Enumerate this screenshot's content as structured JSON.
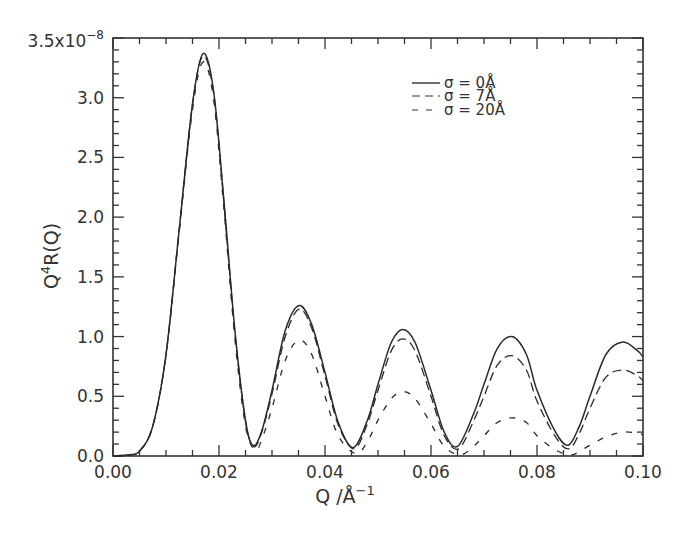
{
  "chart_data": {
    "type": "line",
    "title": "",
    "xlabel": "Q  /Å⁻¹",
    "ylabel": "Q⁴R(Q)",
    "xlim": [
      0.0,
      0.1
    ],
    "ylim": [
      0.0,
      3.5
    ],
    "y_scale_label": "3.5x10⁻⁸",
    "x_ticks": [
      "0.00",
      "0.02",
      "0.04",
      "0.06",
      "0.08",
      "0.10"
    ],
    "x_tick_values": [
      0.0,
      0.02,
      0.04,
      0.06,
      0.08,
      0.1
    ],
    "y_ticks": [
      "0.0",
      "0.5",
      "1.0",
      "1.5",
      "2.0",
      "2.5",
      "3.0",
      "3.5x10⁻⁸"
    ],
    "y_tick_values": [
      0.0,
      0.5,
      1.0,
      1.5,
      2.0,
      2.5,
      3.0,
      3.5
    ],
    "x_minor_step": 0.005,
    "y_minor_step": 0.1,
    "grid": false,
    "legend_position": "upper right",
    "series": [
      {
        "name": "σ  =  0Å",
        "style": "solid",
        "x": [
          0,
          0.003,
          0.005,
          0.0075,
          0.01,
          0.0125,
          0.015,
          0.017,
          0.019,
          0.021,
          0.023,
          0.025,
          0.0264,
          0.028,
          0.03,
          0.0325,
          0.0351,
          0.0375,
          0.04,
          0.0425,
          0.0453,
          0.048,
          0.05,
          0.0525,
          0.0547,
          0.057,
          0.06,
          0.0625,
          0.065,
          0.068,
          0.07,
          0.0725,
          0.0753,
          0.078,
          0.08,
          0.0835,
          0.0859,
          0.088,
          0.09,
          0.093,
          0.0962,
          0.099,
          0.1
        ],
        "values": [
          0,
          0.01,
          0.04,
          0.25,
          0.85,
          1.9,
          2.95,
          3.37,
          3.05,
          2.1,
          1.05,
          0.3,
          0.09,
          0.2,
          0.55,
          1.05,
          1.26,
          1.1,
          0.7,
          0.28,
          0.07,
          0.3,
          0.6,
          0.95,
          1.06,
          0.95,
          0.55,
          0.2,
          0.08,
          0.35,
          0.6,
          0.9,
          1.0,
          0.85,
          0.55,
          0.2,
          0.09,
          0.25,
          0.5,
          0.85,
          0.955,
          0.88,
          0.83
        ]
      },
      {
        "name": "σ  =  7Å",
        "style": "dashed",
        "x": [
          0,
          0.003,
          0.005,
          0.0075,
          0.01,
          0.0125,
          0.015,
          0.017,
          0.019,
          0.021,
          0.023,
          0.025,
          0.0265,
          0.028,
          0.03,
          0.0325,
          0.0351,
          0.0375,
          0.04,
          0.0425,
          0.0455,
          0.048,
          0.05,
          0.0525,
          0.0547,
          0.057,
          0.06,
          0.0625,
          0.0652,
          0.068,
          0.07,
          0.0725,
          0.0753,
          0.078,
          0.08,
          0.0835,
          0.086,
          0.088,
          0.09,
          0.093,
          0.0962,
          0.099,
          0.1
        ],
        "values": [
          0,
          0.01,
          0.04,
          0.25,
          0.85,
          1.9,
          2.94,
          3.35,
          3.03,
          2.08,
          1.03,
          0.29,
          0.08,
          0.19,
          0.52,
          1.0,
          1.23,
          1.07,
          0.67,
          0.26,
          0.06,
          0.27,
          0.55,
          0.88,
          0.98,
          0.88,
          0.5,
          0.17,
          0.06,
          0.29,
          0.5,
          0.76,
          0.84,
          0.72,
          0.46,
          0.16,
          0.06,
          0.19,
          0.4,
          0.66,
          0.72,
          0.67,
          0.63
        ]
      },
      {
        "name": "σ  =  20Å",
        "style": "dash-sparse",
        "x": [
          0,
          0.003,
          0.005,
          0.0075,
          0.01,
          0.0125,
          0.015,
          0.017,
          0.019,
          0.021,
          0.023,
          0.025,
          0.0268,
          0.028,
          0.03,
          0.0325,
          0.0351,
          0.0375,
          0.04,
          0.0425,
          0.0458,
          0.048,
          0.05,
          0.0525,
          0.0547,
          0.057,
          0.06,
          0.0625,
          0.0655,
          0.068,
          0.07,
          0.0725,
          0.0753,
          0.078,
          0.08,
          0.0835,
          0.0865,
          0.088,
          0.09,
          0.093,
          0.0962,
          0.099,
          0.1
        ],
        "values": [
          0,
          0.01,
          0.04,
          0.25,
          0.84,
          1.88,
          2.9,
          3.3,
          2.98,
          2.03,
          0.98,
          0.25,
          0.05,
          0.13,
          0.4,
          0.8,
          0.97,
          0.85,
          0.5,
          0.17,
          0.02,
          0.12,
          0.3,
          0.48,
          0.54,
          0.48,
          0.27,
          0.08,
          0.01,
          0.08,
          0.17,
          0.28,
          0.32,
          0.28,
          0.17,
          0.05,
          0.01,
          0.04,
          0.09,
          0.16,
          0.2,
          0.19,
          0.18
        ]
      }
    ]
  },
  "legend": {
    "items": [
      {
        "label": "σ  =  0Å"
      },
      {
        "label": "σ  =  7Å"
      },
      {
        "label": "σ  =  20Å"
      }
    ]
  },
  "axes": {
    "xlabel_main": "Q  /Å",
    "xlabel_exp": "−1",
    "ylabel_main": "Q",
    "ylabel_exp": "4",
    "ylabel_rest": "R(Q)",
    "ytop_main": "3.5x10",
    "ytop_exp": "−8"
  }
}
